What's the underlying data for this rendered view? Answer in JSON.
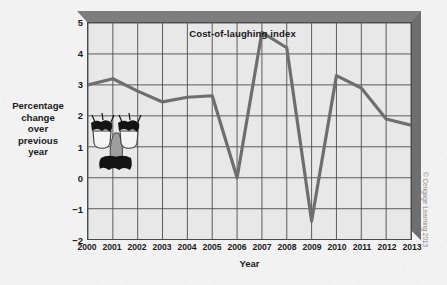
{
  "chart_data": {
    "type": "line",
    "title": "Cost-of-laughing index",
    "xlabel": "Year",
    "ylabel": "Percentage change over previous year",
    "ylabel_lines": [
      "Percentage",
      "change",
      "over",
      "previous",
      "year"
    ],
    "categories": [
      "2000",
      "2001",
      "2002",
      "2003",
      "2004",
      "2005",
      "2006",
      "2007",
      "2008",
      "2009",
      "2010",
      "2011",
      "2012",
      "2013"
    ],
    "values": [
      3.0,
      3.2,
      2.8,
      2.45,
      2.6,
      2.65,
      0.0,
      4.7,
      4.2,
      -1.4,
      3.3,
      2.9,
      1.9,
      1.7
    ],
    "x": [
      2000,
      2001,
      2002,
      2003,
      2004,
      2005,
      2006,
      2007,
      2008,
      2009,
      2010,
      2011,
      2012,
      2013
    ],
    "ylim": [
      -2,
      5
    ],
    "yticks": [
      5,
      4,
      3,
      2,
      1,
      0,
      -1,
      -2
    ],
    "ytick_labels": [
      "5",
      "4",
      "3",
      "2",
      "1",
      "0",
      "−1",
      "−2"
    ],
    "xlim": [
      2000,
      2013
    ],
    "grid": true,
    "legend": "none",
    "series_color": "#6e6e6e",
    "plot_bg": "#e8e8e8",
    "grid_color": "#4a4a4a",
    "frame_color": "#7d7d7d"
  },
  "annotations": {
    "copyright": "© Cengage Learning 2013",
    "overlay_icon": "groucho-glasses-disguise"
  },
  "colors": {
    "page_background": "#f2f2f2",
    "text": "#1a1a1a",
    "copyright_text": "#8a8a8a"
  }
}
